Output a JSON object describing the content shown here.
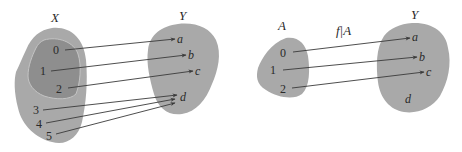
{
  "colors": {
    "set_fill": "#a9a9a9",
    "subset_fill": "#8e8e8e",
    "subset_border": "#c4c4c4",
    "arrow": "#3a3a3a",
    "text": "#2a2a2a"
  },
  "left_diagram": {
    "domain": {
      "name": "X",
      "elements": [
        "0",
        "1",
        "2",
        "3",
        "4",
        "5"
      ],
      "subset_elements": [
        "0",
        "1",
        "2"
      ]
    },
    "codomain": {
      "name": "Y",
      "elements": [
        "a",
        "b",
        "c",
        "d"
      ]
    },
    "mapping": [
      {
        "from": "0",
        "to": "a"
      },
      {
        "from": "1",
        "to": "b"
      },
      {
        "from": "2",
        "to": "c"
      },
      {
        "from": "3",
        "to": "d"
      },
      {
        "from": "4",
        "to": "d"
      },
      {
        "from": "5",
        "to": "d"
      }
    ]
  },
  "right_diagram": {
    "function_label": "f|A",
    "domain": {
      "name": "A",
      "elements": [
        "0",
        "1",
        "2"
      ]
    },
    "codomain": {
      "name": "Y",
      "elements": [
        "a",
        "b",
        "c",
        "d"
      ]
    },
    "mapping": [
      {
        "from": "0",
        "to": "a"
      },
      {
        "from": "1",
        "to": "b"
      },
      {
        "from": "2",
        "to": "c"
      }
    ]
  }
}
